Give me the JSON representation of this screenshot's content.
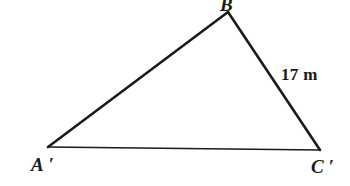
{
  "figure": {
    "type": "triangle-diagram",
    "background_color": "#ffffff",
    "stroke_color": "#1a1a1a",
    "vertices": [
      {
        "id": "A",
        "label": "A ′",
        "x": 48,
        "y": 147
      },
      {
        "id": "B",
        "label": "B",
        "x": 228,
        "y": 12
      },
      {
        "id": "C",
        "label": "C ′",
        "x": 320,
        "y": 150
      }
    ],
    "sides": [
      {
        "id": "AB",
        "from": "A",
        "to": "B",
        "label": ""
      },
      {
        "id": "BC",
        "from": "B",
        "to": "C",
        "label": "17 m"
      },
      {
        "id": "CA",
        "from": "C",
        "to": "A",
        "label": ""
      }
    ],
    "labels": {
      "vertex_a": "A ′",
      "vertex_b": "B",
      "vertex_c": "C ′",
      "side_bc_measure": "17 m"
    }
  }
}
